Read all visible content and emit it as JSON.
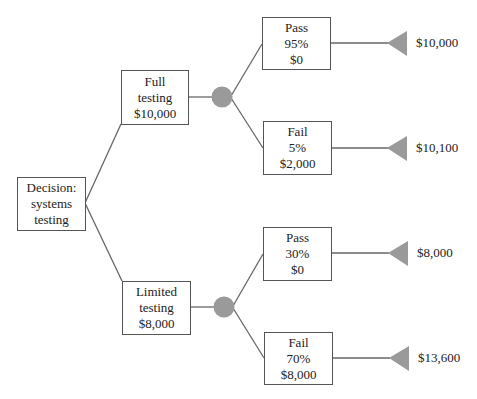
{
  "diagram": {
    "type": "decision-tree",
    "colors": {
      "line": "#666666",
      "box_border": "#555555",
      "chance_node": "#9a9a9a",
      "terminal_node": "#9a9a9a",
      "text": "#222222",
      "background": "#ffffff"
    },
    "root": {
      "lines": [
        "Decision:",
        "systems",
        "testing"
      ]
    },
    "branches": [
      {
        "id": "full",
        "lines": [
          "Full",
          "testing",
          "$10,000"
        ],
        "outcomes": [
          {
            "id": "full-pass",
            "lines": [
              "Pass",
              "95%",
              "$0"
            ],
            "payoff": "$10,000"
          },
          {
            "id": "full-fail",
            "lines": [
              "Fail",
              "5%",
              "$2,000"
            ],
            "payoff": "$10,100"
          }
        ]
      },
      {
        "id": "limited",
        "lines": [
          "Limited",
          "testing",
          "$8,000"
        ],
        "outcomes": [
          {
            "id": "limited-pass",
            "lines": [
              "Pass",
              "30%",
              "$0"
            ],
            "payoff": "$8,000"
          },
          {
            "id": "limited-fail",
            "lines": [
              "Fail",
              "70%",
              "$8,000"
            ],
            "payoff": "$13,600"
          }
        ]
      }
    ]
  }
}
